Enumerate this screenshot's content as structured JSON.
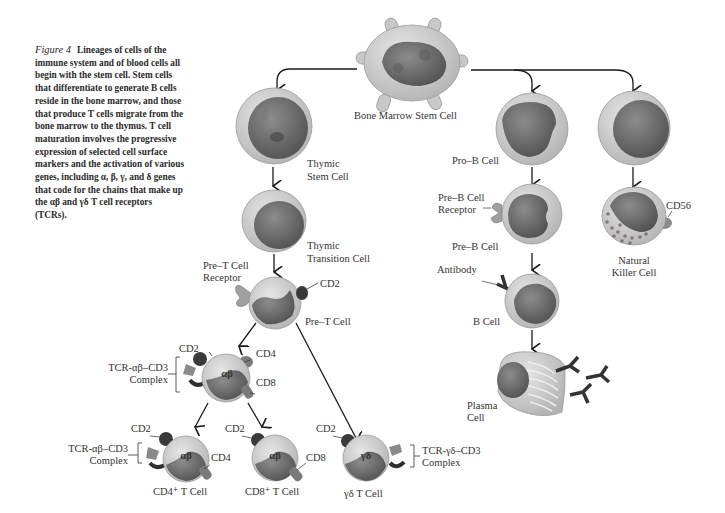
{
  "caption": {
    "figure_label": "Figure 4",
    "text": "Lineages of cells of the immune system and of blood cells all begin with the stem cell. Stem cells that differentiate to generate B cells reside in the bone marrow, and those that produce T cells migrate from the bone marrow to the thymus. T cell maturation involves the progressive expression of selected cell surface markers and the activation of various genes, including α, β, γ, and δ genes that code for the chains that make up the αβ and γδ T cell receptors (TCRs)."
  },
  "cells": {
    "bone_marrow_stem": "Bone Marrow Stem Cell",
    "thymic_stem_1": "Thymic",
    "thymic_stem_2": "Stem Cell",
    "thymic_transition_1": "Thymic",
    "thymic_transition_2": "Transition Cell",
    "pre_t": "Pre–T Cell",
    "cd4_t": "CD4⁺ T Cell",
    "cd8_t": "CD8⁺ T Cell",
    "gd_t": "γδ T Cell",
    "pro_b": "Pro–B Cell",
    "pre_b": "Pre–B Cell",
    "b_cell": "B Cell",
    "plasma_1": "Plasma",
    "plasma_2": "Cell",
    "nk_1": "Natural",
    "nk_2": "Killer Cell"
  },
  "markers": {
    "pre_t_receptor_1": "Pre–T Cell",
    "pre_t_receptor_2": "Receptor",
    "cd2": "CD2",
    "cd4": "CD4",
    "cd8": "CD8",
    "cd56": "CD56",
    "tcr_ab_1": "TCR-αβ–CD3",
    "tcr_ab_2": "Complex",
    "tcr_gd_1": "TCR-γδ–CD3",
    "tcr_gd_2": "Complex",
    "pre_b_receptor_1": "Pre–B Cell",
    "pre_b_receptor_2": "Receptor",
    "antibody": "Antibody",
    "ab_symbol": "αβ",
    "gd_symbol": "γδ"
  },
  "colors": {
    "cytoplasm": "#c9c9c9",
    "nucleus": "#6e6e6e",
    "marker_dark": "#3a3a3a",
    "marker_mid": "#7a7a7a",
    "arrow": "#1a1a1a"
  }
}
